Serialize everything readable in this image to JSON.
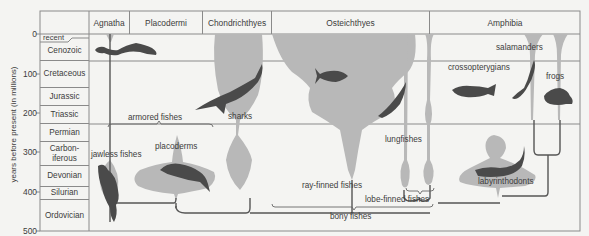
{
  "diagram": {
    "y_axis": {
      "label": "years before present (in millions)",
      "ticks": [
        "0",
        "100",
        "200",
        "300",
        "400",
        "500"
      ]
    },
    "periods": [
      {
        "name": "recent"
      },
      {
        "name": "Cenozoic"
      },
      {
        "name": "Cretaceous"
      },
      {
        "name": "Jurassic"
      },
      {
        "name": "Triassic"
      },
      {
        "name": "Permian"
      },
      {
        "name": "Carbon-\niferous"
      },
      {
        "name": "Devonian"
      },
      {
        "name": "Silurian"
      },
      {
        "name": "Ordovician"
      }
    ],
    "groups": [
      {
        "name": "Agnatha"
      },
      {
        "name": "Placodermi"
      },
      {
        "name": "Chondrichthyes"
      },
      {
        "name": "Osteichthyes"
      },
      {
        "name": "Amphibia"
      }
    ],
    "labels": {
      "jawless_fishes": "jawless fishes",
      "armored_fishes": "armored fishes",
      "placoderms": "placoderms",
      "sharks": "sharks",
      "ray_finned_fishes": "ray-finned fishes",
      "lobe_finned_fishes": "lobe-finned fishes",
      "bony_fishes": "bony fishes",
      "lungfishes": "lungfishes",
      "crossopterygians": "crossopterygians",
      "labyrinthodonts": "labyrinthodonts",
      "salamanders": "salamanders",
      "frogs": "frogs"
    },
    "colors": {
      "background": "#f4f4f2",
      "grid": "#8a8a8a",
      "spindle": "#b8b8b8",
      "silhouette": "#4a4a4a",
      "line": "#555555"
    }
  }
}
